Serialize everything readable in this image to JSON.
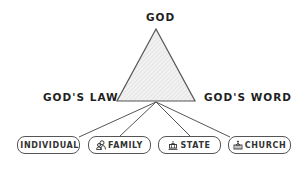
{
  "diagram": {
    "apex_label": "GOD",
    "left_label": "GOD'S LAW",
    "right_label": "GOD'S WORD",
    "line_color": "#555555",
    "triangle_fill": "#efefef",
    "nodes": [
      {
        "label": "INDIVIDUAL",
        "icon": "person-icon"
      },
      {
        "label": "FAMILY",
        "icon": "family-icon"
      },
      {
        "label": "STATE",
        "icon": "government-building-icon"
      },
      {
        "label": "CHURCH",
        "icon": "church-icon"
      }
    ]
  }
}
